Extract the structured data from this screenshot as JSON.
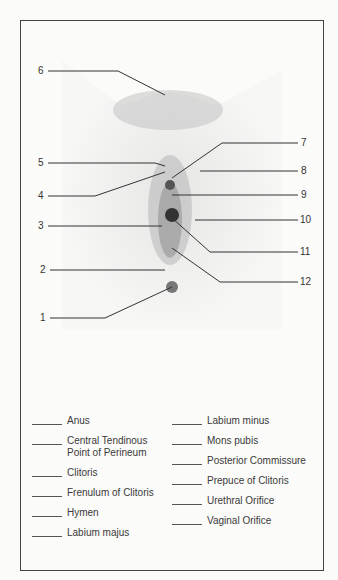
{
  "diagram": {
    "title": "",
    "callouts": [
      {
        "num": "1",
        "x": 40,
        "y": 318
      },
      {
        "num": "2",
        "x": 40,
        "y": 270
      },
      {
        "num": "3",
        "x": 38,
        "y": 226
      },
      {
        "num": "4",
        "x": 38,
        "y": 196
      },
      {
        "num": "5",
        "x": 38,
        "y": 163
      },
      {
        "num": "6",
        "x": 38,
        "y": 71
      },
      {
        "num": "7",
        "x": 301,
        "y": 143
      },
      {
        "num": "8",
        "x": 301,
        "y": 171
      },
      {
        "num": "9",
        "x": 301,
        "y": 195
      },
      {
        "num": "10",
        "x": 300,
        "y": 220
      },
      {
        "num": "11",
        "x": 300,
        "y": 252
      },
      {
        "num": "12",
        "x": 300,
        "y": 282
      }
    ]
  },
  "answer_key": {
    "left": [
      {
        "label": "Anus"
      },
      {
        "label": "Central Tendinous\nPoint of Perineum"
      },
      {
        "label": "Clitoris"
      },
      {
        "label": "Frenulum of Clitoris"
      },
      {
        "label": "Hymen"
      },
      {
        "label": "Labium majus"
      }
    ],
    "right": [
      {
        "label": "Labium minus"
      },
      {
        "label": "Mons pubis"
      },
      {
        "label": "Posterior Commissure"
      },
      {
        "label": "Prepuce of Clitoris"
      },
      {
        "label": "Urethral Orifice"
      },
      {
        "label": "Vaginal Orifice"
      }
    ]
  }
}
